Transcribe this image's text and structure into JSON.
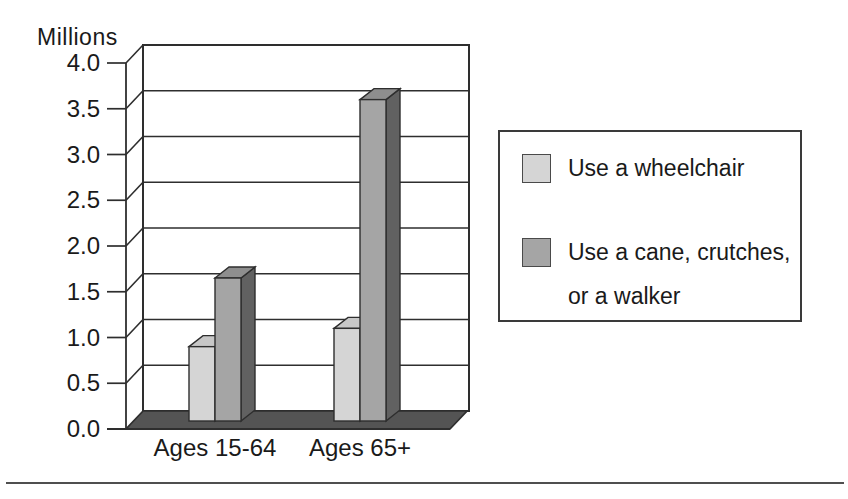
{
  "page": {
    "width": 848,
    "height": 499,
    "background": "#ffffff"
  },
  "chart_data": {
    "type": "bar",
    "style": "3d-column",
    "title": "",
    "ylabel": "Millions",
    "xlabel": "",
    "categories": [
      "Ages 15-64",
      "Ages 65+"
    ],
    "series": [
      {
        "name": "Use a wheelchair",
        "values": [
          0.9,
          1.1
        ]
      },
      {
        "name": "Use a cane, crutches, or a walker",
        "values": [
          1.65,
          3.6
        ]
      }
    ],
    "ylim": [
      0,
      4.0
    ],
    "ytick_step": 0.5,
    "ytick_labels": [
      "0.0",
      "0.5",
      "1.0",
      "1.5",
      "2.0",
      "2.5",
      "3.0",
      "3.5",
      "4.0"
    ],
    "grid": true,
    "legend_position": "right"
  },
  "colors": {
    "series_wheelchair": {
      "front": "#d5d5d5",
      "top": "#c7c7c7",
      "side": "#a9a9a9"
    },
    "series_cane": {
      "front": "#a5a5a5",
      "top": "#8e8e8e",
      "side": "#616161"
    },
    "floor": "#545454",
    "wall": "#ffffff",
    "line": "#2e2e2e",
    "text": "#1a1a1a",
    "divider": "#4f4f4f"
  }
}
